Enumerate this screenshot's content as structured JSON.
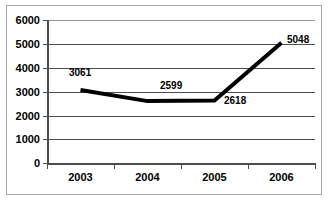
{
  "chart_data": {
    "type": "line",
    "title": "",
    "xlabel": "",
    "ylabel": "",
    "categories": [
      "2003",
      "2004",
      "2005",
      "2006"
    ],
    "values": [
      3061,
      2599,
      2618,
      5048
    ],
    "series": [
      {
        "name": "Series 1",
        "values": [
          3061,
          2599,
          2618,
          5048
        ]
      }
    ],
    "data_labels": [
      "3061",
      "2599",
      "2618",
      "5048"
    ],
    "ylim": [
      0,
      6000
    ],
    "ytick_labels": [
      "6000",
      "5000",
      "4000",
      "3000",
      "2000",
      "1000",
      "0"
    ],
    "ytick_values": [
      6000,
      5000,
      4000,
      3000,
      2000,
      1000,
      0
    ],
    "grid": true,
    "legend": "none",
    "colors": {
      "series_line": "#000000",
      "gridline": "#4d4d4d",
      "axis": "#4d4d4d",
      "plot_background": "#ffffff",
      "frame_border": "#a8a8a8",
      "text": "#000000"
    }
  },
  "axis": {
    "y_ticks": [
      {
        "label": "6000"
      },
      {
        "label": "5000"
      },
      {
        "label": "4000"
      },
      {
        "label": "3000"
      },
      {
        "label": "2000"
      },
      {
        "label": "1000"
      },
      {
        "label": "0"
      }
    ],
    "x_ticks": [
      {
        "label": "2003"
      },
      {
        "label": "2004"
      },
      {
        "label": "2005"
      },
      {
        "label": "2006"
      }
    ]
  },
  "labels": {
    "p0": "3061",
    "p1": "2599",
    "p2": "2618",
    "p3": "5048"
  }
}
